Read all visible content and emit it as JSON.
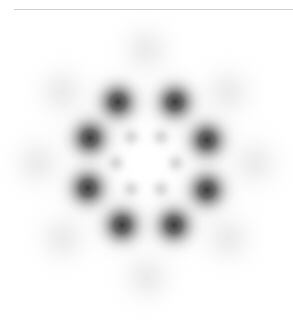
{
  "canvas": {
    "width": 293,
    "height": 325,
    "background_color": "#ffffff",
    "title": "Hexagonal blob lattice pattern"
  },
  "divider": {
    "name": "top-horizontal-rule",
    "x": 14,
    "y": 9,
    "width": 279,
    "height": 1,
    "color": "#cfcfcf"
  },
  "pattern": {
    "center_x": 146,
    "center_y": 163,
    "center_highlight": {
      "label": "bright-core",
      "radius": 22,
      "color": "#ffffff"
    },
    "rings": [
      {
        "name": "inner-ring",
        "count": 6,
        "radius": 30,
        "start_angle_deg": 0,
        "blob_radius": 11,
        "peak_gray": "#d8d8d8",
        "intensity": 0.16
      },
      {
        "name": "middle-ring",
        "count": 6,
        "radius": 63,
        "start_angle_deg": 30,
        "blob_radius": 22,
        "peak_gray": "#3c3c3c",
        "intensity": 0.95
      },
      {
        "name": "outer-ring",
        "count": 12,
        "radius": 118,
        "start_angle_deg": 0,
        "blob_radius": 30,
        "peak_gray": "#ececec",
        "intensity": 0.09
      }
    ],
    "blobs": [
      {
        "id": "inner-1",
        "ring": "inner-ring",
        "x": 176,
        "y": 163,
        "r": 11,
        "gray": 216
      },
      {
        "id": "inner-2",
        "ring": "inner-ring",
        "x": 161,
        "y": 137,
        "r": 11,
        "gray": 216
      },
      {
        "id": "inner-3",
        "ring": "inner-ring",
        "x": 131,
        "y": 137,
        "r": 11,
        "gray": 216
      },
      {
        "id": "inner-4",
        "ring": "inner-ring",
        "x": 116,
        "y": 163,
        "r": 11,
        "gray": 216
      },
      {
        "id": "inner-5",
        "ring": "inner-ring",
        "x": 131,
        "y": 189,
        "r": 11,
        "gray": 216
      },
      {
        "id": "inner-6",
        "ring": "inner-ring",
        "x": 161,
        "y": 189,
        "r": 11,
        "gray": 216
      },
      {
        "id": "mid-top-left",
        "ring": "middle-ring",
        "x": 118,
        "y": 102,
        "r": 22,
        "gray": 60
      },
      {
        "id": "mid-top-right",
        "ring": "middle-ring",
        "x": 175,
        "y": 102,
        "r": 22,
        "gray": 60
      },
      {
        "id": "mid-right-upper",
        "ring": "middle-ring",
        "x": 207,
        "y": 140,
        "r": 22,
        "gray": 60
      },
      {
        "id": "mid-right-lower",
        "ring": "middle-ring",
        "x": 207,
        "y": 190,
        "r": 22,
        "gray": 60
      },
      {
        "id": "mid-bottom-right",
        "ring": "middle-ring",
        "x": 174,
        "y": 225,
        "r": 22,
        "gray": 60
      },
      {
        "id": "mid-bottom-left",
        "ring": "middle-ring",
        "x": 122,
        "y": 225,
        "r": 22,
        "gray": 60
      },
      {
        "id": "mid-left-lower",
        "ring": "middle-ring",
        "x": 88,
        "y": 188,
        "r": 22,
        "gray": 60
      },
      {
        "id": "mid-left-upper",
        "ring": "middle-ring",
        "x": 90,
        "y": 138,
        "r": 22,
        "gray": 60
      },
      {
        "id": "out-top",
        "ring": "outer-ring",
        "x": 146,
        "y": 50,
        "r": 30,
        "gray": 236
      },
      {
        "id": "out-top-left",
        "ring": "outer-ring",
        "x": 62,
        "y": 92,
        "r": 30,
        "gray": 236
      },
      {
        "id": "out-top-right",
        "ring": "outer-ring",
        "x": 228,
        "y": 92,
        "r": 30,
        "gray": 236
      },
      {
        "id": "out-left",
        "ring": "outer-ring",
        "x": 38,
        "y": 163,
        "r": 30,
        "gray": 236
      },
      {
        "id": "out-right",
        "ring": "outer-ring",
        "x": 255,
        "y": 163,
        "r": 30,
        "gray": 236
      },
      {
        "id": "out-bottom-left",
        "ring": "outer-ring",
        "x": 63,
        "y": 238,
        "r": 30,
        "gray": 236
      },
      {
        "id": "out-bottom-right",
        "ring": "outer-ring",
        "x": 228,
        "y": 238,
        "r": 30,
        "gray": 236
      },
      {
        "id": "out-bottom",
        "ring": "outer-ring",
        "x": 147,
        "y": 277,
        "r": 30,
        "gray": 236
      }
    ]
  }
}
